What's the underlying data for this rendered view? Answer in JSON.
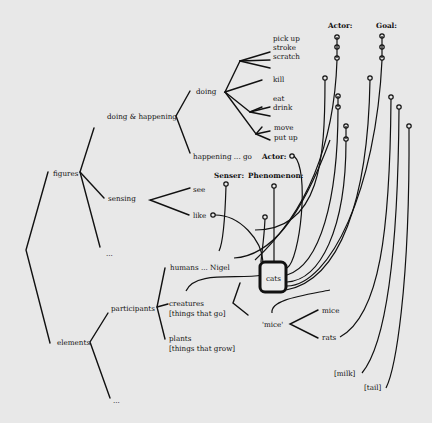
{
  "diagram": {
    "tree": {
      "figures": "figures",
      "doing_happening": "doing & happening",
      "doing": "doing",
      "happening": "happening ... go",
      "sensing": "sensing",
      "see": "see",
      "like": "like",
      "figures_other": "...",
      "elements": "elements",
      "participants": "participants",
      "humans": "humans ... Nigel",
      "creatures": "creatures",
      "creatures_gloss": "[things that go]",
      "plants": "plants",
      "plants_gloss": "[things that grow]",
      "elements_other": "...",
      "cats": "cats",
      "mice_class": "'mice'",
      "mice": "mice",
      "rats": "rats",
      "milk": "[milk]",
      "tail": "[tail]"
    },
    "doing_verbs": {
      "pick_up": "pick up",
      "stroke": "stroke",
      "scratch": "scratch",
      "kill": "kill",
      "eat": "eat",
      "drink": "drink",
      "move": "move",
      "put_up": "put up"
    },
    "roles": {
      "actor_top": "Actor:",
      "goal_top": "Goal:",
      "actor_happening": "Actor:",
      "senser": "Senser:",
      "phenomenon": "Phenomenon:"
    }
  }
}
